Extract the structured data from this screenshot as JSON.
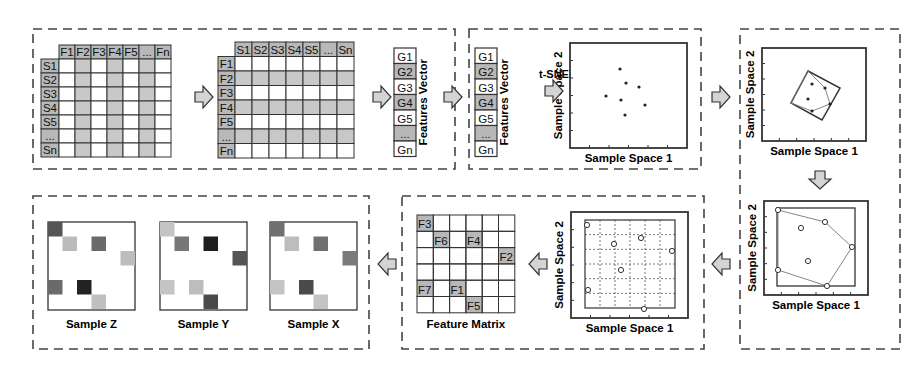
{
  "diagram": {
    "colors": {
      "line": "#333333",
      "shade": "#c8c8c8",
      "header_shade": "#b8b8b8",
      "arrow_fill": "#d4d4d4",
      "dashed": "#444444"
    }
  },
  "panel1": {
    "table1": {
      "col_headers": [
        "F1",
        "F2",
        "F3",
        "F4",
        "F5",
        "...",
        "Fn"
      ],
      "row_headers": [
        "S1",
        "S2",
        "S3",
        "S4",
        "S5",
        "...",
        "Sn"
      ],
      "shaded_cols": [
        1,
        3,
        5
      ]
    },
    "table2": {
      "col_headers": [
        "S1",
        "S2",
        "S3",
        "S4",
        "S5",
        "...",
        "Sn"
      ],
      "row_headers": [
        "F1",
        "F2",
        "F3",
        "F4",
        "F5",
        "...",
        "Fn"
      ],
      "shaded_rows": [
        1,
        3,
        5
      ]
    },
    "vector": {
      "items": [
        "G1",
        "G2",
        "G3",
        "G4",
        "G5",
        "...",
        "Gn"
      ],
      "shaded": [
        1,
        3,
        5
      ],
      "label": "Features Vector"
    }
  },
  "panel2": {
    "vector": {
      "items": [
        "G1",
        "G2",
        "G3",
        "G4",
        "G5",
        "...",
        "Gn"
      ],
      "shaded": [
        1,
        3,
        5
      ],
      "label": "Features Vector"
    },
    "arrow_label": "t-SNE",
    "plot": {
      "xlabel": "Sample Space 1",
      "ylabel": "Sample Space 2",
      "points": [
        [
          620,
          69
        ],
        [
          626,
          83
        ],
        [
          639,
          87
        ],
        [
          606,
          96
        ],
        [
          621,
          100
        ],
        [
          645,
          105
        ],
        [
          625,
          115
        ]
      ]
    }
  },
  "panel3": {
    "plot": {
      "xlabel": "Sample Space 1",
      "ylabel": "Sample Space 2",
      "rect_corners": [
        [
          808,
          71
        ],
        [
          840,
          88
        ],
        [
          822,
          120
        ],
        [
          791,
          103
        ]
      ],
      "hull": [
        [
          808,
          71
        ],
        [
          825,
          88
        ],
        [
          830,
          104
        ],
        [
          812,
          111
        ],
        [
          791,
          103
        ]
      ],
      "points": [
        [
          812,
          84
        ],
        [
          825,
          88
        ],
        [
          808,
          99
        ],
        [
          830,
          104
        ],
        [
          812,
          111
        ]
      ]
    }
  },
  "panel4": {
    "plot": {
      "xlabel": "Sample Space 1",
      "ylabel": "Sample Space 2",
      "points": [
        [
          778,
          210
        ],
        [
          825,
          222
        ],
        [
          801,
          228
        ],
        [
          852,
          247
        ],
        [
          808,
          261
        ],
        [
          778,
          270
        ],
        [
          827,
          286
        ]
      ],
      "hull": [
        [
          778,
          210
        ],
        [
          825,
          222
        ],
        [
          852,
          247
        ],
        [
          827,
          286
        ],
        [
          778,
          270
        ]
      ]
    }
  },
  "panel5": {
    "plot": {
      "xlabel": "Sample Space 1",
      "ylabel": "Sample Space 2",
      "points": [
        [
          587,
          225
        ],
        [
          641,
          238
        ],
        [
          614,
          244
        ],
        [
          672,
          251
        ],
        [
          621,
          270
        ],
        [
          588,
          290
        ],
        [
          644,
          309
        ]
      ]
    },
    "feature_matrix": {
      "label": "Feature Matrix",
      "size": 6,
      "cells": [
        {
          "label": "F3",
          "col": 0,
          "row": 0
        },
        {
          "label": "F6",
          "col": 1,
          "row": 1
        },
        {
          "label": "F4",
          "col": 3,
          "row": 1
        },
        {
          "label": "F2",
          "col": 5,
          "row": 2
        },
        {
          "label": "F7",
          "col": 0,
          "row": 4
        },
        {
          "label": "F1",
          "col": 2,
          "row": 4
        },
        {
          "label": "F5",
          "col": 3,
          "row": 5
        }
      ]
    }
  },
  "panel6": {
    "samples": [
      {
        "label": "Sample Z",
        "colors": [
          "#555555",
          "#bbbbbb",
          "#6a6a6a",
          "#bdbdbd",
          "#6a6a6a",
          "#222222",
          "#c0c0c0"
        ]
      },
      {
        "label": "Sample Y",
        "colors": [
          "#c4c4c4",
          "#777777",
          "#1e1e1e",
          "#555555",
          "#c4c4c4",
          "#bdbdbd",
          "#4a4a4a"
        ]
      },
      {
        "label": "Sample X",
        "colors": [
          "#707070",
          "#bdbdbd",
          "#707070",
          "#7a7a7a",
          "#c4c4c4",
          "#4a4a4a",
          "#c4c4c4"
        ]
      }
    ]
  }
}
